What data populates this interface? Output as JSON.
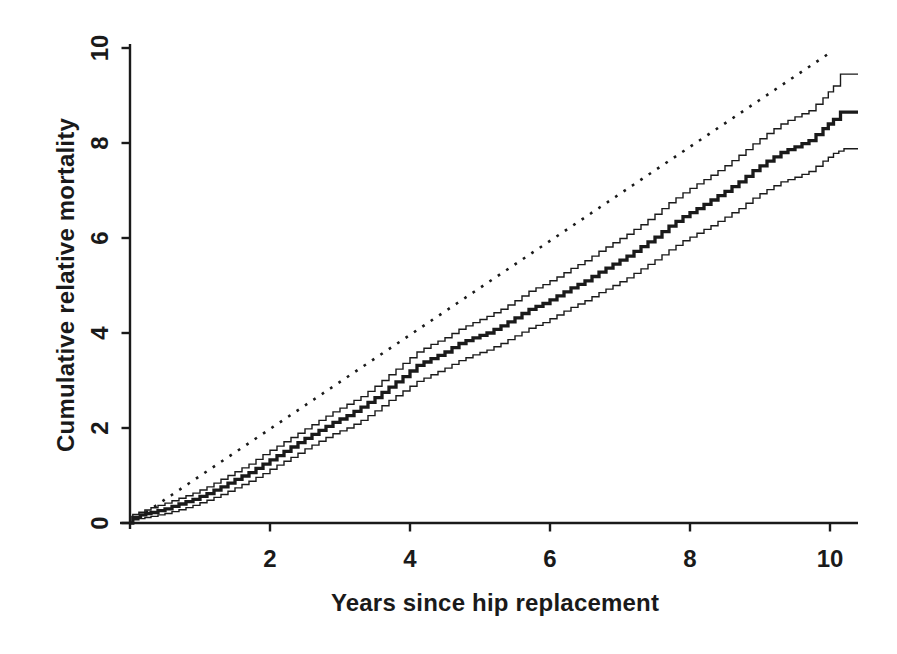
{
  "page": {
    "background": "#ffffff",
    "ink_color": "#1a1a1a"
  },
  "chart_data": {
    "type": "line",
    "subtype": "step-survival-curve-with-confidence-bands",
    "title": "",
    "xlabel": "Years since hip replacement",
    "ylabel": "Cumulative relative mortality",
    "xlim": [
      0,
      10.4
    ],
    "ylim": [
      0,
      10
    ],
    "xticks": [
      2,
      4,
      6,
      8,
      10
    ],
    "yticks": [
      0,
      2,
      4,
      6,
      8,
      10
    ],
    "grid": false,
    "legend": "none",
    "series": [
      {
        "name": "expected_reference",
        "style": "dotted",
        "line_width": 2.6,
        "points": [
          [
            0,
            0
          ],
          [
            10,
            9.9
          ]
        ]
      },
      {
        "name": "upper_confidence_band",
        "style": "step",
        "line_width": 1.4,
        "points": [
          [
            0,
            0
          ],
          [
            0.04,
            0.18
          ],
          [
            0.3,
            0.32
          ],
          [
            0.5,
            0.42
          ],
          [
            0.7,
            0.52
          ],
          [
            0.9,
            0.63
          ],
          [
            1.1,
            0.76
          ],
          [
            1.3,
            0.92
          ],
          [
            1.5,
            1.08
          ],
          [
            1.7,
            1.24
          ],
          [
            1.9,
            1.44
          ],
          [
            2.1,
            1.62
          ],
          [
            2.3,
            1.8
          ],
          [
            2.5,
            1.98
          ],
          [
            2.7,
            2.16
          ],
          [
            2.9,
            2.34
          ],
          [
            3.1,
            2.5
          ],
          [
            3.3,
            2.66
          ],
          [
            3.5,
            2.88
          ],
          [
            3.7,
            3.12
          ],
          [
            3.9,
            3.36
          ],
          [
            4.1,
            3.6
          ],
          [
            4.3,
            3.76
          ],
          [
            4.5,
            3.9
          ],
          [
            4.7,
            4.08
          ],
          [
            4.9,
            4.22
          ],
          [
            5.1,
            4.35
          ],
          [
            5.3,
            4.5
          ],
          [
            5.5,
            4.68
          ],
          [
            5.7,
            4.88
          ],
          [
            5.9,
            5.02
          ],
          [
            6.1,
            5.18
          ],
          [
            6.3,
            5.36
          ],
          [
            6.5,
            5.52
          ],
          [
            6.7,
            5.72
          ],
          [
            6.9,
            5.9
          ],
          [
            7.1,
            6.08
          ],
          [
            7.3,
            6.28
          ],
          [
            7.5,
            6.5
          ],
          [
            7.7,
            6.74
          ],
          [
            7.9,
            6.95
          ],
          [
            8.1,
            7.14
          ],
          [
            8.3,
            7.32
          ],
          [
            8.5,
            7.52
          ],
          [
            8.7,
            7.74
          ],
          [
            8.9,
            7.98
          ],
          [
            9.1,
            8.2
          ],
          [
            9.3,
            8.4
          ],
          [
            9.5,
            8.55
          ],
          [
            9.7,
            8.68
          ],
          [
            9.9,
            8.95
          ],
          [
            10.05,
            9.2
          ],
          [
            10.15,
            9.45
          ],
          [
            10.4,
            9.45
          ]
        ]
      },
      {
        "name": "point_estimate",
        "style": "step",
        "line_width": 3.3,
        "points": [
          [
            0,
            0
          ],
          [
            0.04,
            0.12
          ],
          [
            0.15,
            0.17
          ],
          [
            0.3,
            0.22
          ],
          [
            0.5,
            0.3
          ],
          [
            0.7,
            0.4
          ],
          [
            0.9,
            0.5
          ],
          [
            1.1,
            0.62
          ],
          [
            1.3,
            0.76
          ],
          [
            1.5,
            0.92
          ],
          [
            1.7,
            1.06
          ],
          [
            1.9,
            1.24
          ],
          [
            2.1,
            1.42
          ],
          [
            2.3,
            1.6
          ],
          [
            2.5,
            1.78
          ],
          [
            2.7,
            1.95
          ],
          [
            2.9,
            2.12
          ],
          [
            3.1,
            2.26
          ],
          [
            3.3,
            2.44
          ],
          [
            3.5,
            2.64
          ],
          [
            3.7,
            2.86
          ],
          [
            3.9,
            3.08
          ],
          [
            4.1,
            3.32
          ],
          [
            4.3,
            3.46
          ],
          [
            4.5,
            3.6
          ],
          [
            4.7,
            3.78
          ],
          [
            4.9,
            3.9
          ],
          [
            5.1,
            4.0
          ],
          [
            5.3,
            4.15
          ],
          [
            5.5,
            4.32
          ],
          [
            5.7,
            4.5
          ],
          [
            5.9,
            4.62
          ],
          [
            6.1,
            4.78
          ],
          [
            6.3,
            4.95
          ],
          [
            6.5,
            5.1
          ],
          [
            6.7,
            5.28
          ],
          [
            6.9,
            5.45
          ],
          [
            7.1,
            5.62
          ],
          [
            7.3,
            5.82
          ],
          [
            7.5,
            6.02
          ],
          [
            7.7,
            6.25
          ],
          [
            7.9,
            6.45
          ],
          [
            8.1,
            6.62
          ],
          [
            8.3,
            6.8
          ],
          [
            8.5,
            6.98
          ],
          [
            8.7,
            7.18
          ],
          [
            8.9,
            7.42
          ],
          [
            9.1,
            7.62
          ],
          [
            9.3,
            7.8
          ],
          [
            9.5,
            7.92
          ],
          [
            9.7,
            8.05
          ],
          [
            9.9,
            8.3
          ],
          [
            10.05,
            8.5
          ],
          [
            10.15,
            8.65
          ],
          [
            10.4,
            8.65
          ]
        ]
      },
      {
        "name": "lower_confidence_band",
        "style": "step",
        "line_width": 1.4,
        "points": [
          [
            0,
            0
          ],
          [
            0.04,
            0.07
          ],
          [
            0.3,
            0.14
          ],
          [
            0.5,
            0.2
          ],
          [
            0.7,
            0.28
          ],
          [
            0.9,
            0.37
          ],
          [
            1.1,
            0.48
          ],
          [
            1.3,
            0.6
          ],
          [
            1.5,
            0.74
          ],
          [
            1.7,
            0.88
          ],
          [
            1.9,
            1.04
          ],
          [
            2.1,
            1.22
          ],
          [
            2.3,
            1.38
          ],
          [
            2.5,
            1.56
          ],
          [
            2.7,
            1.72
          ],
          [
            2.9,
            1.88
          ],
          [
            3.1,
            2.0
          ],
          [
            3.3,
            2.16
          ],
          [
            3.5,
            2.36
          ],
          [
            3.7,
            2.58
          ],
          [
            3.9,
            2.78
          ],
          [
            4.1,
            2.98
          ],
          [
            4.3,
            3.12
          ],
          [
            4.5,
            3.26
          ],
          [
            4.7,
            3.42
          ],
          [
            4.9,
            3.54
          ],
          [
            5.1,
            3.64
          ],
          [
            5.3,
            3.78
          ],
          [
            5.5,
            3.94
          ],
          [
            5.7,
            4.1
          ],
          [
            5.9,
            4.22
          ],
          [
            6.1,
            4.38
          ],
          [
            6.3,
            4.54
          ],
          [
            6.5,
            4.68
          ],
          [
            6.7,
            4.85
          ],
          [
            6.9,
            5.0
          ],
          [
            7.1,
            5.16
          ],
          [
            7.3,
            5.35
          ],
          [
            7.5,
            5.54
          ],
          [
            7.7,
            5.75
          ],
          [
            7.9,
            5.94
          ],
          [
            8.1,
            6.1
          ],
          [
            8.3,
            6.26
          ],
          [
            8.5,
            6.44
          ],
          [
            8.7,
            6.62
          ],
          [
            8.9,
            6.84
          ],
          [
            9.1,
            7.02
          ],
          [
            9.3,
            7.18
          ],
          [
            9.5,
            7.28
          ],
          [
            9.7,
            7.4
          ],
          [
            9.9,
            7.62
          ],
          [
            10.05,
            7.78
          ],
          [
            10.2,
            7.88
          ],
          [
            10.4,
            7.88
          ]
        ]
      }
    ]
  }
}
